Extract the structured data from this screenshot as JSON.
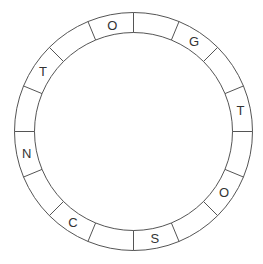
{
  "puzzle": {
    "type": "circular-letter-ring",
    "segment_count": 16,
    "start_direction": "top, clockwise",
    "segments": [
      {
        "index": 0,
        "letter": ""
      },
      {
        "index": 1,
        "letter": "G"
      },
      {
        "index": 2,
        "letter": ""
      },
      {
        "index": 3,
        "letter": "T"
      },
      {
        "index": 4,
        "letter": ""
      },
      {
        "index": 5,
        "letter": "O"
      },
      {
        "index": 6,
        "letter": ""
      },
      {
        "index": 7,
        "letter": "S"
      },
      {
        "index": 8,
        "letter": ""
      },
      {
        "index": 9,
        "letter": "C"
      },
      {
        "index": 10,
        "letter": ""
      },
      {
        "index": 11,
        "letter": "N"
      },
      {
        "index": 12,
        "letter": ""
      },
      {
        "index": 13,
        "letter": "T"
      },
      {
        "index": 14,
        "letter": ""
      },
      {
        "index": 15,
        "letter": "O"
      }
    ]
  },
  "geometry": {
    "cx": 133.5,
    "cy": 131.5,
    "outer_r": 119,
    "inner_r": 99
  },
  "colors": {
    "line": "#555555",
    "text": "#333333",
    "background": "#ffffff"
  }
}
